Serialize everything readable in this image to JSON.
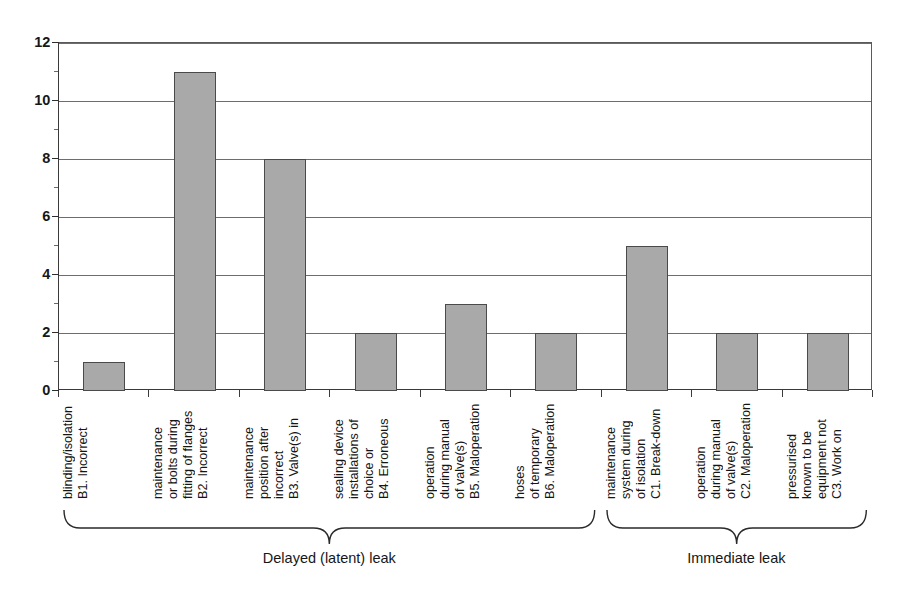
{
  "chart_data": {
    "type": "bar",
    "title": "",
    "subtitle": "",
    "xlabel": "",
    "ylabel": "",
    "ylim": [
      0,
      12
    ],
    "ytick_step": 2,
    "yticks": [
      "0",
      "2",
      "4",
      "6",
      "8",
      "10",
      "12"
    ],
    "grid": true,
    "legend": "none",
    "bar_color": "#a9a9a9",
    "bar_border_color": "#4a4a4a",
    "categories": [
      "B1. Incorrect blinding/isolation",
      "B2.  Incorrect fitting of flanges or bolts during maintenance",
      "B3. Valve(s) in incorrect position after maintenance",
      "B4. Erroneous choice or installations of sealing device",
      "B5. Maloperation of valve(s) during manual operation",
      "B6. Maloperation of temporary hoses",
      "C1. Break-down of isolation system during maintenance",
      "C2. Maloperation of valve(s) during manual operation",
      "C3. Work on equipment not known to be pressurised"
    ],
    "category_lines": [
      [
        "B1. Incorrect",
        "blinding/isolation"
      ],
      [
        "B2.  Incorrect",
        "fitting of flanges",
        "or bolts during",
        "maintenance"
      ],
      [
        "B3. Valve(s) in",
        "incorrect",
        "position after",
        "maintenance"
      ],
      [
        "B4. Erroneous",
        "choice or",
        "installations of",
        "sealing device"
      ],
      [
        "B5. Maloperation",
        "of valve(s)",
        "during manual",
        "operation"
      ],
      [
        "B6. Maloperation",
        "of temporary",
        "hoses"
      ],
      [
        "C1. Break-down",
        "of isolation",
        "system during",
        "maintenance"
      ],
      [
        "C2. Maloperation",
        "of valve(s)",
        "during manual",
        "operation"
      ],
      [
        "C3. Work on",
        "equipment not",
        "known to be",
        "pressurised"
      ]
    ],
    "values": [
      1,
      11,
      8,
      2,
      3,
      2,
      5,
      2,
      2
    ],
    "groups": [
      {
        "label": "Delayed (latent) leak",
        "from": 0,
        "to": 5
      },
      {
        "label": "Immediate leak",
        "from": 6,
        "to": 8
      }
    ]
  }
}
